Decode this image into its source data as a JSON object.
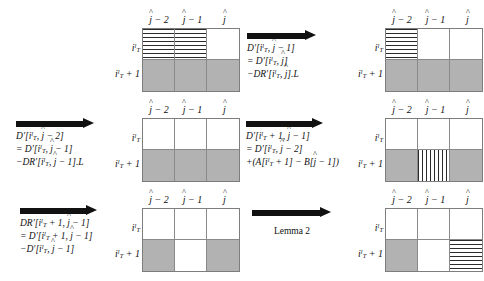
{
  "figure": {
    "type": "dynamic-programming-state-transition-diagram",
    "columns": [
      "j-2",
      "j-1",
      "j"
    ],
    "rows": [
      "i_T^l",
      "i_T^l + 1"
    ],
    "legend": {
      "gray": "#b2b2b2",
      "hatch": "#2b2b2b",
      "white": "#ffffff",
      "arrow": "#111111"
    }
  },
  "panels": [
    {
      "id": "panel-1",
      "position": "top-left",
      "arrow": null,
      "caption_lines": [],
      "cells": [
        [
          "hhatch",
          "hhatch",
          "white"
        ],
        [
          "gray",
          "gray",
          "gray"
        ]
      ]
    },
    {
      "id": "panel-2",
      "position": "top-right",
      "arrow": "right-arrow",
      "caption_lines": [
        "D'[i_T^l, j-1]",
        "= D'[i_T^l, j]",
        "-DR'[i_T^l, j].L"
      ],
      "cells": [
        [
          "hhatch",
          "white",
          "white"
        ],
        [
          "gray",
          "gray",
          "gray"
        ]
      ]
    },
    {
      "id": "panel-3",
      "position": "middle-left",
      "arrow": "right-arrow",
      "caption_lines": [
        "D'[i_T^l, j-2]",
        "= D'[i_T^l, j-1]",
        "-DR'[i_T^l, j-1].L"
      ],
      "cells": [
        [
          "white",
          "white",
          "white"
        ],
        [
          "gray",
          "gray",
          "gray"
        ]
      ]
    },
    {
      "id": "panel-4",
      "position": "middle-right",
      "arrow": "right-arrow",
      "caption_lines": [
        "D'[i_T^l + 1, j-1]",
        "= D'[i_T^l, j-2]",
        "+(A[i_T^l + 1] - B[j-1])"
      ],
      "cells": [
        [
          "white",
          "white",
          "white"
        ],
        [
          "gray",
          "vhatch",
          "gray"
        ]
      ]
    },
    {
      "id": "panel-5",
      "position": "bottom-left",
      "arrow": "right-arrow",
      "caption_lines": [
        "DR'[i_T^l + 1, j-1]",
        "= D'[i_T^l + 1, j-1]",
        "-D'[i_T^l, j-1]"
      ],
      "cells": [
        [
          "white",
          "white",
          "white"
        ],
        [
          "gray",
          "white",
          "gray"
        ]
      ]
    },
    {
      "id": "panel-6",
      "position": "bottom-right",
      "arrow": "right-arrow",
      "caption_lines": [
        "Lemma 2"
      ],
      "caption_style": "plain",
      "cells": [
        [
          "white",
          "white",
          "white"
        ],
        [
          "gray",
          "white",
          "hhatch"
        ]
      ]
    }
  ]
}
